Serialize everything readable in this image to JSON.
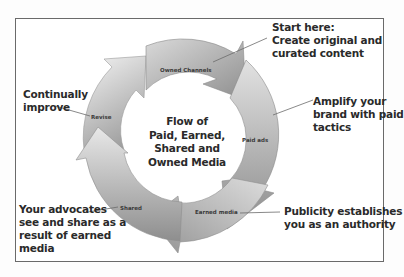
{
  "diagram": {
    "center_title": [
      "Flow of",
      "Paid, Earned,",
      "Shared and",
      "Owned Media"
    ],
    "segments": [
      {
        "id": "owned",
        "label": "Owned Channels"
      },
      {
        "id": "paid",
        "label": "Paid ads"
      },
      {
        "id": "earned",
        "label": "Earned media"
      },
      {
        "id": "shared",
        "label": "Shared"
      },
      {
        "id": "revise",
        "label": "Revise"
      }
    ],
    "callouts": [
      {
        "id": "start",
        "lines": [
          "Start here:",
          "Create original and",
          "curated content"
        ]
      },
      {
        "id": "amplify",
        "lines": [
          "Amplify your",
          "brand with paid",
          "tactics"
        ]
      },
      {
        "id": "publicity",
        "lines": [
          "Publicity establishes",
          "you as an authority"
        ]
      },
      {
        "id": "advocates",
        "lines": [
          "Your advocates",
          "see and share as a",
          "result of earned",
          "media"
        ]
      },
      {
        "id": "improve",
        "lines": [
          "Continually",
          "improve"
        ]
      }
    ],
    "colors": {
      "arrow_light": "#e4e4e4",
      "arrow_mid": "#b4b4b4",
      "arrow_dark": "#8a8a8a",
      "leader_line": "#6b6b6b",
      "frame_border": "#6a6a6a",
      "text": "#2a2a2a"
    }
  }
}
